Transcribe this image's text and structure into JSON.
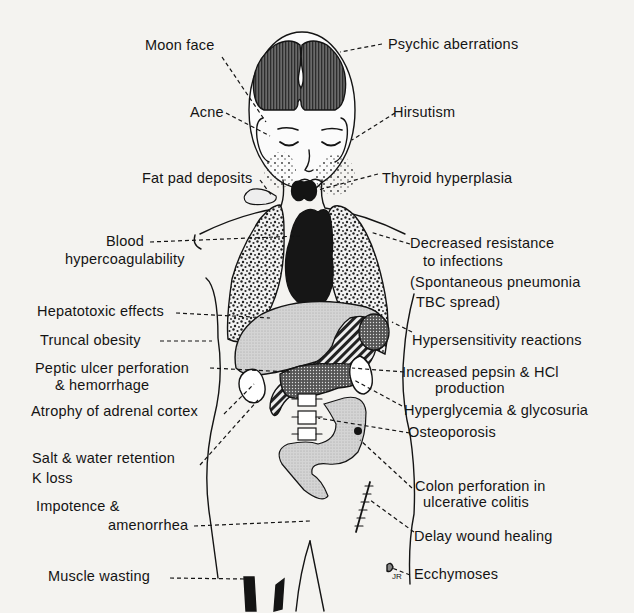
{
  "figure": {
    "signature": "JR",
    "colors": {
      "background": "#f4f3f0",
      "ink": "#141414",
      "brain_fill": "#5a5a5a",
      "heart_fill": "#1a1a1a",
      "liver_fill": "#d6d6d6",
      "colon_fill": "#d9d9d9"
    }
  },
  "labels": {
    "moon_face": "Moon face",
    "psychic": "Psychic aberrations",
    "acne": "Acne",
    "hirsutism": "Hirsutism",
    "fat_pad": "Fat pad deposits",
    "thyroid": "Thyroid hyperplasia",
    "blood_1": "Blood",
    "blood_2": "hypercoagulability",
    "infection_1": "Decreased resistance",
    "infection_2": "to infections",
    "infection_3": "(Spontaneous pneumonia",
    "infection_4": "TBC spread)",
    "hepatotoxic": "Hepatotoxic effects",
    "truncal": "Truncal obesity",
    "hypersensitivity": "Hypersensitivity reactions",
    "peptic_1": "Peptic ulcer perforation",
    "peptic_2": "& hemorrhage",
    "pepsin_1": "Increased pepsin & HCl",
    "pepsin_2": "production",
    "adrenal": "Atrophy of adrenal cortex",
    "hyperglycemia": "Hyperglycemia & glycosuria",
    "osteoporosis": "Osteoporosis",
    "salt_1": "Salt & water retention",
    "salt_2": "K loss",
    "colon_1": "Colon perforation in",
    "colon_2": "ulcerative colitis",
    "impotence_1": "Impotence &",
    "impotence_2": "amenorrhea",
    "wound": "Delay wound healing",
    "muscle": "Muscle wasting",
    "ecchymoses": "Ecchymoses"
  }
}
